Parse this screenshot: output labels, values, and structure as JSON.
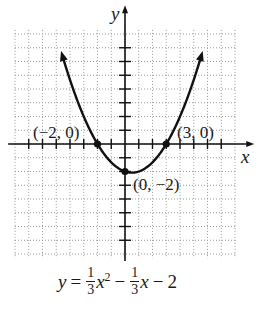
{
  "chart_data": {
    "type": "line",
    "title": "",
    "function": "y = (1/3)x^2 - (1/3)x - 2",
    "xlabel": "x",
    "ylabel": "y",
    "xlim": [
      -8,
      8
    ],
    "ylim": [
      -8,
      8
    ],
    "grid": true,
    "grid_style": "dotted",
    "tick_spacing": 1,
    "series": [
      {
        "name": "parabola",
        "x": [
          -4.6,
          -4,
          -3,
          -2,
          -1,
          0,
          0.5,
          1,
          2,
          3,
          4,
          5,
          5.6
        ],
        "y": [
          6.59,
          4.67,
          2,
          0,
          -1.33,
          -2,
          -2.08,
          -2,
          -1.33,
          0,
          2,
          4.67,
          6.59
        ]
      }
    ],
    "annotations": [
      {
        "label": "(−2, 0)",
        "x": -2,
        "y": 0
      },
      {
        "label": "(3, 0)",
        "x": 3,
        "y": 0
      },
      {
        "label": "(0, −2)",
        "x": 0,
        "y": -2
      }
    ]
  },
  "labels": {
    "x_axis": "x",
    "y_axis": "y",
    "point_left": "(−2, 0)",
    "point_right": "(3, 0)",
    "point_intercept": "(0, −2)"
  },
  "equation": {
    "lhs": "y",
    "equals": "=",
    "frac1_num": "1",
    "frac1_den": "3",
    "var1": "x",
    "exp": "2",
    "minus1": "−",
    "frac2_num": "1",
    "frac2_den": "3",
    "var2": "x",
    "minus2": "−",
    "const": "2"
  },
  "colors": {
    "curve": "#111111",
    "axis": "#111111",
    "grid": "#9a9a9a",
    "background": "#ffffff"
  }
}
